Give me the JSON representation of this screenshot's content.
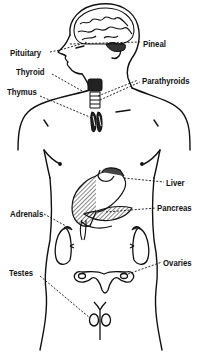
{
  "diagram": {
    "ink_color": "#111111",
    "background": "#ffffff",
    "labels": [
      {
        "id": "pituitary",
        "text": "Pituitary",
        "side": "left"
      },
      {
        "id": "pineal",
        "text": "Pineal",
        "side": "right"
      },
      {
        "id": "thyroid",
        "text": "Thyroid",
        "side": "left"
      },
      {
        "id": "parathyroids",
        "text": "Parathyroids",
        "side": "right"
      },
      {
        "id": "thymus",
        "text": "Thymus",
        "side": "left"
      },
      {
        "id": "liver",
        "text": "Liver",
        "side": "right"
      },
      {
        "id": "pancreas",
        "text": "Pancreas",
        "side": "right"
      },
      {
        "id": "adrenals",
        "text": "Adrenals",
        "side": "left"
      },
      {
        "id": "ovaries",
        "text": "Ovaries",
        "side": "right"
      },
      {
        "id": "testes",
        "text": "Testes",
        "side": "left"
      }
    ]
  }
}
